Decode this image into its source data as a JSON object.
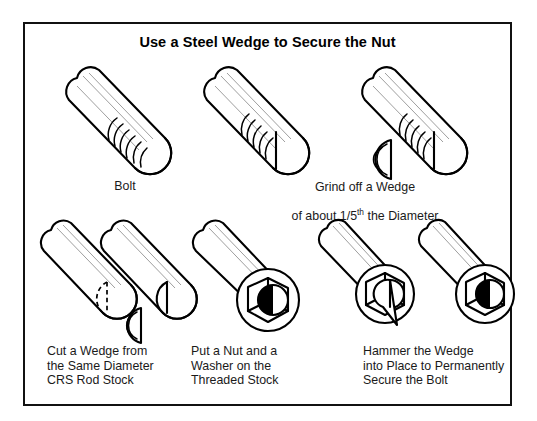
{
  "diagram": {
    "title": "Use a Steel Wedge to Secure the Nut",
    "border_color": "#111111",
    "background_color": "#ffffff",
    "ink_color": "#000000",
    "steps": [
      {
        "id": "step-bolt",
        "caption": "Bolt",
        "caption_align": "center",
        "illustration": "threaded-bolt-rod"
      },
      {
        "id": "step-grind-wedge",
        "caption_line1": "Grind off a Wedge",
        "caption_line2_prefix": "of about 1/5",
        "caption_line2_sup": "th",
        "caption_line2_suffix": " the Diameter",
        "caption_align": "center",
        "illustration": "bolt-with-flat-ground-face"
      },
      {
        "id": "step-wedge-removed",
        "caption": "",
        "illustration": "bolt-with-detached-wedge"
      },
      {
        "id": "step-cut-wedge",
        "caption": "Cut a Wedge from\nthe Same Diameter\nCRS Rod Stock",
        "caption_align": "left",
        "illustration": "two-rods-dashed-cut-and-wedge"
      },
      {
        "id": "step-nut-washer",
        "caption": "Put a Nut and a\nWasher on the\nThreaded Stock",
        "caption_align": "left",
        "illustration": "rod-with-nut-and-washer"
      },
      {
        "id": "step-hammer-wedge",
        "caption": "Hammer the Wedge\ninto Place to Permanently\nSecure the Bolt",
        "caption_align": "left",
        "illustration": "two-assemblies-wedge-driven-home"
      }
    ]
  }
}
